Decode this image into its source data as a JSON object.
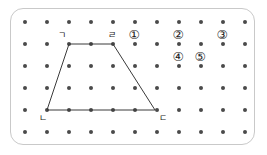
{
  "figure": {
    "frame": {
      "x": 10,
      "y": 8,
      "width": 245,
      "height": 137,
      "border_color": "#c9c9c9",
      "background_color": "#ffffff",
      "corner_radius": 13
    },
    "grid": {
      "columns": 11,
      "rows": 6,
      "x_start": 25,
      "y_start": 22,
      "spacing_x": 22,
      "spacing_y": 22,
      "dot_color": "#4a4a4a",
      "dot_diameter": 4
    },
    "shape": {
      "name": "trapezoid",
      "stroke_color": "#3a3a3a",
      "stroke_width": 1,
      "fill": "none",
      "points": "69,44 113,44 155,110 47,110",
      "vertices": [
        {
          "label": "ㄱ",
          "point_x": 69,
          "point_y": 44,
          "label_x": 62,
          "label_y": 35
        },
        {
          "label": "ㄹ",
          "point_x": 113,
          "point_y": 44,
          "label_x": 112,
          "label_y": 35
        },
        {
          "label": "ㄷ",
          "point_x": 155,
          "point_y": 110,
          "label_x": 163,
          "label_y": 118
        },
        {
          "label": "ㄴ",
          "point_x": 47,
          "point_y": 110,
          "label_x": 43,
          "label_y": 118
        }
      ]
    },
    "choices": [
      {
        "label": "①",
        "x": 134,
        "y": 35
      },
      {
        "label": "②",
        "x": 178,
        "y": 35
      },
      {
        "label": "③",
        "x": 222,
        "y": 35
      },
      {
        "label": "④",
        "x": 178,
        "y": 57
      },
      {
        "label": "⑤",
        "x": 200,
        "y": 57
      }
    ]
  }
}
